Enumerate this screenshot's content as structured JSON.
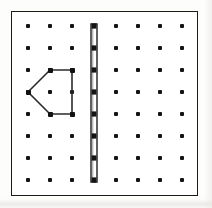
{
  "figure": {
    "canvas": {
      "width": 212,
      "height": 208,
      "background": "#fdfdfc"
    },
    "board": {
      "label": "geoboard",
      "frame": {
        "x": 11,
        "y": 11,
        "width": 187,
        "height": 185
      },
      "border_color": "#1b1b1b",
      "fill_color": "#ffffff"
    },
    "grid": {
      "label": "peg array",
      "rows": 8,
      "columns": 8,
      "origin_x": 28,
      "origin_y": 26,
      "spacing_x": 22,
      "spacing_y": 22,
      "peg_color": "#151515",
      "peg_size": 4
    },
    "shapes": [
      {
        "name": "pentagon-band",
        "kind": "polygon",
        "closed": true,
        "stroke_color": "#2b2b2b",
        "stroke_width": 1.6,
        "vertices_grid": [
          {
            "col": 1,
            "row": 4
          },
          {
            "col": 2,
            "row": 3
          },
          {
            "col": 3,
            "row": 3
          },
          {
            "col": 3,
            "row": 5
          },
          {
            "col": 2,
            "row": 5
          }
        ],
        "points": "28,92 50,70 72,70 72,114 50,114"
      },
      {
        "name": "vertical-band",
        "kind": "segment-band",
        "stroke_color": "#2b2b2b",
        "fill_color": "#ffffff",
        "shade_color": "#b9b9b9",
        "column": 4,
        "row_start": 1,
        "row_end": 8,
        "x": 93.5,
        "y_top": 26,
        "y_bottom": 180,
        "band_width": 6
      }
    ]
  }
}
